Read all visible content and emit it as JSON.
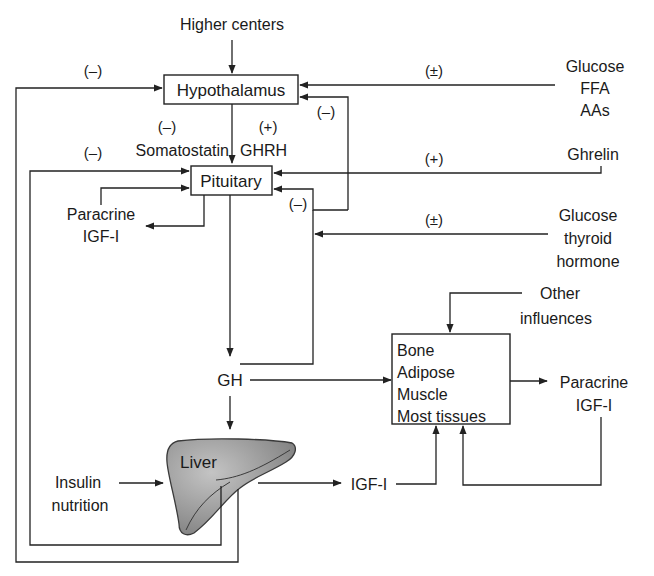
{
  "diagram": {
    "nodes": {
      "higher_centers": "Higher centers",
      "hypothalamus": "Hypothalamus",
      "pituitary": "Pituitary",
      "somatostatin": "Somatostatin",
      "ghrh": "GHRH",
      "gh": "GH",
      "liver": "Liver",
      "igf1": "IGF-I",
      "paracrine_left": [
        "Paracrine",
        "IGF-I"
      ],
      "paracrine_right": [
        "Paracrine",
        "IGF-I"
      ],
      "glucose_ffa_aas": [
        "Glucose",
        "FFA",
        "AAs"
      ],
      "ghrelin": "Ghrelin",
      "glucose_thyroid": [
        "Glucose",
        "thyroid",
        "hormone"
      ],
      "other_influences": [
        "Other",
        "influences"
      ],
      "insulin_nutrition": [
        "Insulin",
        "nutrition"
      ],
      "tissues": [
        "Bone",
        "Adipose",
        "Muscle",
        "Most tissues"
      ]
    },
    "signs": {
      "outer_loop_to_hypothalamus": "(–)",
      "glucose_to_hypothalamus": "(±)",
      "gh_to_hypothalamus": "(–)",
      "somatostatin": "(–)",
      "ghrh": "(+)",
      "inner_loop_to_pituitary": "(–)",
      "ghrelin_to_pituitary": "(+)",
      "gh_to_pituitary": "(–)",
      "glucose_thyroid": "(±)"
    },
    "colors": {
      "line": "#222222",
      "liver_fill": "#8e8e8e",
      "liver_highlight": "#bdbdbd"
    }
  }
}
